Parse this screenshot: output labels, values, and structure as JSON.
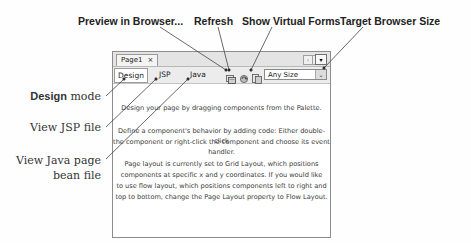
{
  "callouts": {
    "preview": "Preview  in Browser...",
    "refresh": "Refresh",
    "virtual_forms": "Show Virtual Forms",
    "target_size": "Target Browser Size"
  },
  "side_labels": {
    "design_bold": "Design",
    "design_rest": " mode",
    "jsp": "View JSP file",
    "java_line1": "View Java page",
    "java_line2": "bean  file"
  },
  "editor": {
    "tab": {
      "label": "Page1",
      "close": "×"
    },
    "nav": {
      "left": "‹",
      "right": "›",
      "menu": "▾"
    },
    "modes": [
      "Design",
      "JSP",
      "Java"
    ],
    "active_mode": "Design",
    "toolbar_icons": [
      "preview-in-browser-icon",
      "refresh-icon",
      "show-virtual-forms-icon"
    ],
    "target_size": {
      "value": "Any Size",
      "arrow": "⌄"
    }
  },
  "canvas_text": {
    "p1": "Design your page by dragging components from the Palette.",
    "p2_l1": "Define a component's behavior by adding code: Either double-click",
    "p2_l2": "the component or right-click the component and choose its event handler.",
    "p3_l1": "Page layout is currently set to Grid Layout, which positions",
    "p3_l2": "components at specific x and y coordinates.  If you would like",
    "p3_l3": "to use flow layout, which positions components left to right and",
    "p3_l4": "top to bottom, change the Page Layout property to Flow Layout."
  }
}
